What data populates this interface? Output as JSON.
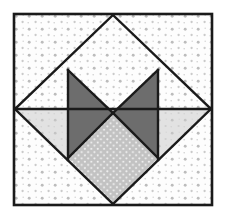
{
  "figure": {
    "canvas": {
      "width": 228,
      "height": 219
    },
    "type": "quilt-block"
  },
  "colors": {
    "background": "#ffffff",
    "outline": "#1a1a1a",
    "dark_gray": "#6d6d6d",
    "medium_gray": "#c2c2c2",
    "light_gray": "#dcdcdc",
    "white_fill": "#fdfdfd",
    "dot_light": "#b8b8b8",
    "dot_white": "#ffffff"
  },
  "geometry": {
    "frame": {
      "x": 14,
      "y": 14,
      "width": 198,
      "height": 191,
      "stroke_width": 2.6
    },
    "diamond_vertices": {
      "top": [
        113,
        15
      ],
      "right": [
        211,
        109
      ],
      "bottom": [
        113,
        204
      ],
      "left": [
        15,
        109
      ]
    },
    "center": [
      113,
      113
    ],
    "midline_y": 109
  },
  "shapes": [
    {
      "name": "outer-frame",
      "fill": "white-dotted",
      "points": "14,14 212,14 212,205 14,205"
    },
    {
      "name": "corner-triangle-top-left",
      "fill": "white-dotted",
      "points": "15,15 113,15 15,109"
    },
    {
      "name": "corner-triangle-top-right",
      "fill": "white-dotted",
      "points": "113,15 211,15 211,109"
    },
    {
      "name": "corner-triangle-bottom-left",
      "fill": "white-dotted",
      "points": "15,109 113,204 15,204"
    },
    {
      "name": "corner-triangle-bottom-right",
      "fill": "white-dotted",
      "points": "211,109 211,204 113,204"
    },
    {
      "name": "diamond-upper-field",
      "fill": "white-dotted",
      "points": "113,15 211,109 15,109"
    },
    {
      "name": "side-triangle-left",
      "fill": "light-gray-dotted",
      "points": "15,109 68,109 68,162"
    },
    {
      "name": "side-triangle-right",
      "fill": "light-gray-dotted",
      "points": "211,109 158,109 158,162"
    },
    {
      "name": "dark-triangle-upper-left",
      "fill": "dark-gray",
      "points": "68,70 113,113 68,158"
    },
    {
      "name": "dark-triangle-upper-right",
      "fill": "dark-gray",
      "points": "158,70 158,158 113,113"
    },
    {
      "name": "center-diamond-lower",
      "fill": "medium-gray-dotted",
      "points": "113,113 158,158 113,204 68,158"
    }
  ],
  "lines": [
    {
      "name": "diamond-edge-top-left",
      "from": [
        113,
        15
      ],
      "to": [
        15,
        109
      ]
    },
    {
      "name": "diamond-edge-top-right",
      "from": [
        113,
        15
      ],
      "to": [
        211,
        109
      ]
    },
    {
      "name": "diamond-edge-bottom-left",
      "from": [
        15,
        109
      ],
      "to": [
        113,
        204
      ]
    },
    {
      "name": "diamond-edge-bottom-right",
      "from": [
        211,
        109
      ],
      "to": [
        113,
        204
      ]
    },
    {
      "name": "horizontal-midline-left",
      "from": [
        15,
        109
      ],
      "to": [
        113,
        109
      ]
    },
    {
      "name": "horizontal-midline-right",
      "from": [
        113,
        109
      ],
      "to": [
        211,
        109
      ]
    },
    {
      "name": "bowtie-upper-left-edge",
      "from": [
        68,
        70
      ],
      "to": [
        113,
        113
      ]
    },
    {
      "name": "bowtie-lower-left-edge",
      "from": [
        68,
        158
      ],
      "to": [
        113,
        113
      ]
    },
    {
      "name": "bowtie-upper-right-edge",
      "from": [
        158,
        70
      ],
      "to": [
        113,
        113
      ]
    },
    {
      "name": "bowtie-lower-right-edge",
      "from": [
        158,
        158
      ],
      "to": [
        113,
        113
      ]
    },
    {
      "name": "vertical-left-inner",
      "from": [
        68,
        70
      ],
      "to": [
        68,
        162
      ]
    },
    {
      "name": "vertical-right-inner",
      "from": [
        158,
        70
      ],
      "to": [
        158,
        162
      ]
    }
  ]
}
